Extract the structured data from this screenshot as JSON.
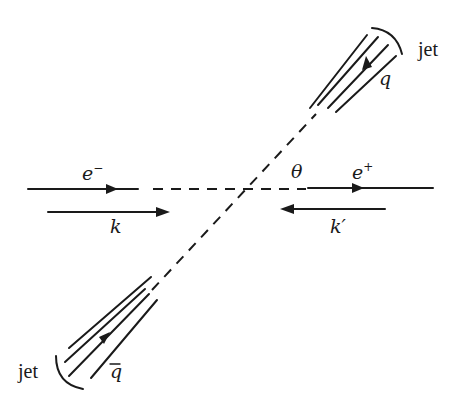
{
  "diagram": {
    "type": "electron-positron annihilation into quark-antiquark jets",
    "labels": {
      "electron": "e",
      "electron_charge": "−",
      "positron": "e",
      "positron_charge": "+",
      "k": "k",
      "k_prime": "k′",
      "theta": "θ",
      "quark": "q",
      "antiquark": "q",
      "jet_upper": "jet",
      "jet_lower": "jet"
    },
    "colors": {
      "ink": "#1a1a1a",
      "background": "#ffffff"
    }
  }
}
